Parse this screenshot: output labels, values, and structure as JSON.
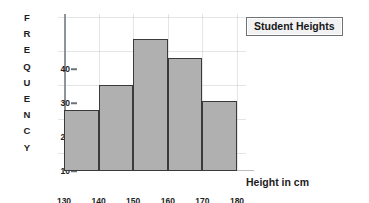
{
  "chart_data": {
    "type": "bar",
    "title": "Student Heights",
    "xlabel": "Height in cm",
    "ylabel": "FREQUENCY",
    "categories": [
      "130-140",
      "140-150",
      "150-160",
      "160-170",
      "170-180"
    ],
    "values": [
      20,
      28,
      43,
      37,
      23
    ],
    "bin_edges": [
      130,
      140,
      150,
      160,
      170,
      180
    ],
    "xticklabels": [
      "130",
      "140",
      "150",
      "160",
      "170",
      "180"
    ],
    "yticklabels": [
      "10",
      "20",
      "30",
      "40"
    ],
    "ytickvalues": [
      10,
      20,
      30,
      40
    ],
    "ylim": [
      0,
      50
    ],
    "xlim": [
      130,
      180
    ],
    "grid": true,
    "legend": "none",
    "colors": {
      "bar_fill": "#b0b0b0",
      "bar_edge": "#3a3a3a",
      "grid": "#a0a8af",
      "axis": "#8f949a",
      "text": "#1d1d1d",
      "title_box_bg": "#f2f2f2",
      "title_box_border": "#6d7276"
    }
  },
  "ylabel_letters": [
    "F",
    "R",
    "E",
    "Q",
    "U",
    "E",
    "N",
    "C",
    "Y"
  ]
}
